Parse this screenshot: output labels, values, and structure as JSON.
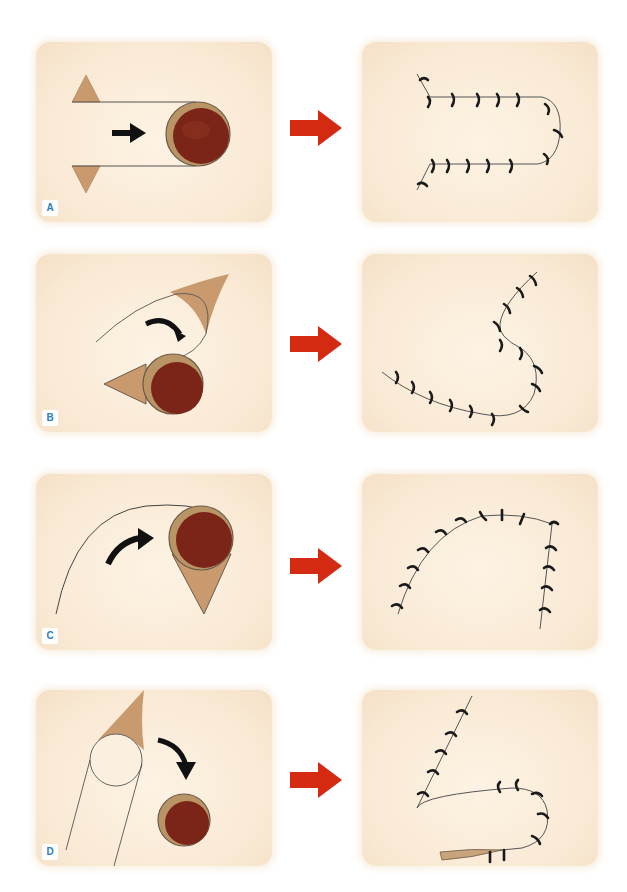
{
  "figure": {
    "rows": [
      {
        "label": "A",
        "name": "advancement-flap"
      },
      {
        "label": "B",
        "name": "rotation-flap"
      },
      {
        "label": "C",
        "name": "rotation-flap-with-triangle"
      },
      {
        "label": "D",
        "name": "transposition-flap"
      }
    ]
  },
  "colors": {
    "panel_bg": "#f9e9d4",
    "flap_tan": "#c89a6e",
    "defect_red": "#7b2418",
    "defect_rim": "#b99566",
    "arrow_red": "#d42a12",
    "suture_black": "#1a1a1a",
    "label_blue": "#2e7dbd"
  }
}
